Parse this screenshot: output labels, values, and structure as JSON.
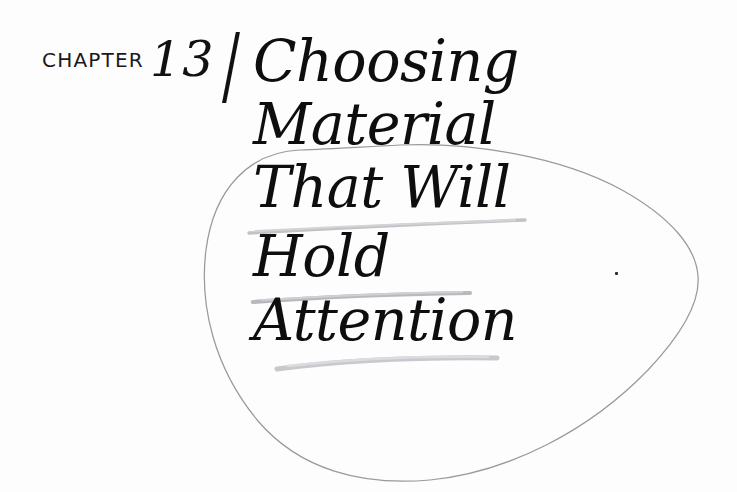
{
  "page": {
    "background_color": "#fdfdfd",
    "ink_color": "#0e0e0e",
    "pencil_color": "#b9b9bd"
  },
  "chapter": {
    "label": "CHAPTER",
    "number": "13",
    "separator": "/"
  },
  "title": {
    "full": "Choosing Material That Will Hold Attention",
    "lines": [
      "Choosing",
      "Material",
      "That Will",
      "Hold",
      "Attention"
    ]
  },
  "annotations": {
    "shape": {
      "name": "hand-drawn-oval",
      "description": "teardrop / egg shaped pencil outline encircling the lower title lines",
      "stroke_color": "#9a9a9e"
    },
    "underlines": [
      {
        "under_line": "That Will",
        "stroke_color": "#c2c2c6"
      },
      {
        "under_line": "Hold",
        "stroke_color": "#bdbdc2"
      },
      {
        "under_line": "Attention",
        "stroke_color": "#c9c9cd"
      }
    ]
  }
}
